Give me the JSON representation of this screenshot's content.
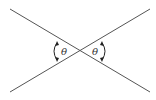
{
  "diagram": {
    "labels": {
      "left_angle": "θ",
      "right_angle": "θ"
    },
    "colors": {
      "line": "#555555",
      "background": "#ffffff"
    }
  }
}
